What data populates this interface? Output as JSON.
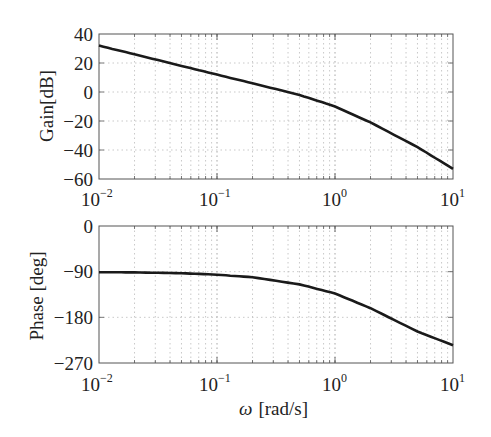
{
  "chart_data": [
    {
      "type": "line",
      "title": "",
      "xlabel": "",
      "ylabel": "Gain[dB]",
      "xscale": "log",
      "xlim": [
        0.01,
        10
      ],
      "ylim": [
        -60,
        40
      ],
      "grid": true,
      "xticks": [
        "10^-2",
        "10^-1",
        "10^0",
        "10^1"
      ],
      "yticks": [
        "40",
        "20",
        "0",
        "-20",
        "-40",
        "-60"
      ],
      "x": [
        0.01,
        0.02,
        0.05,
        0.1,
        0.2,
        0.5,
        1,
        2,
        5,
        10
      ],
      "series": [
        {
          "name": "Gain",
          "values": [
            32,
            26,
            18,
            12,
            6,
            -2,
            -10,
            -21,
            -38,
            -53
          ]
        }
      ]
    },
    {
      "type": "line",
      "title": "",
      "xlabel": "ω [rad/s]",
      "ylabel": "Phase [deg]",
      "xscale": "log",
      "xlim": [
        0.01,
        10
      ],
      "ylim": [
        -270,
        0
      ],
      "grid": true,
      "xticks": [
        "10^-2",
        "10^-1",
        "10^0",
        "10^1"
      ],
      "yticks": [
        "0",
        "-90",
        "-180",
        "-270"
      ],
      "x": [
        0.01,
        0.02,
        0.05,
        0.1,
        0.2,
        0.5,
        1,
        2,
        5,
        10
      ],
      "series": [
        {
          "name": "Phase",
          "values": [
            -91,
            -91.5,
            -93,
            -96,
            -101,
            -115,
            -133,
            -162,
            -208,
            -235
          ]
        }
      ]
    }
  ],
  "gain_plot": {
    "ylabel": "Gain[dB]",
    "yticks": [
      "40",
      "20",
      "0",
      "−20",
      "−40",
      "−60"
    ],
    "xticks": [
      {
        "base": "10",
        "exp": "−2"
      },
      {
        "base": "10",
        "exp": "−1"
      },
      {
        "base": "10",
        "exp": "0"
      },
      {
        "base": "10",
        "exp": "1"
      }
    ]
  },
  "phase_plot": {
    "ylabel": "Phase [deg]",
    "yticks": [
      "0",
      "−90",
      "−180",
      "−270"
    ],
    "xticks": [
      {
        "base": "10",
        "exp": "−2"
      },
      {
        "base": "10",
        "exp": "−1"
      },
      {
        "base": "10",
        "exp": "0"
      },
      {
        "base": "10",
        "exp": "1"
      }
    ],
    "xlabel_symbol": "ω",
    "xlabel_unit": "[rad/s]"
  }
}
